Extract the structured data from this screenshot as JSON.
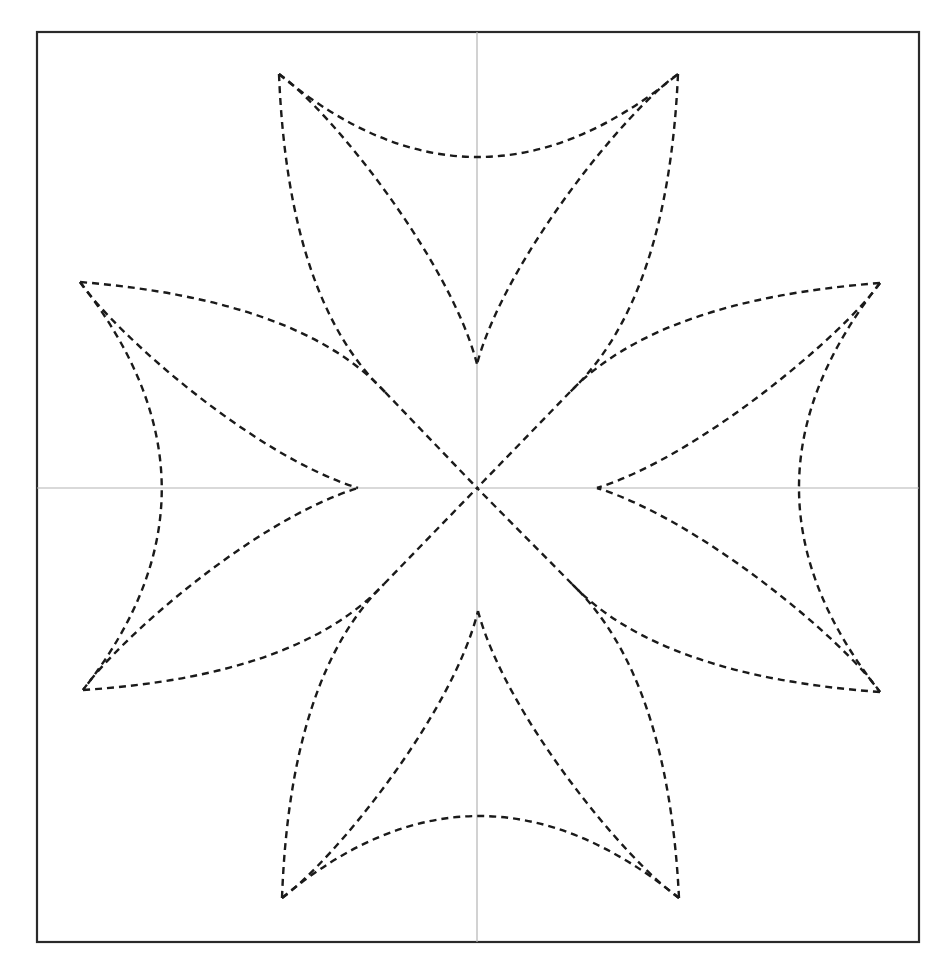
{
  "diagram": {
    "type": "geometric-figure",
    "colors": {
      "background": "#ffffff",
      "frame": "#2a2a2a",
      "axis": "#b4b4b4",
      "curve": "#1a1a1a"
    },
    "frame": {
      "x": 37,
      "y": 32,
      "width": 882,
      "height": 910
    },
    "center": {
      "x": 477,
      "y": 488
    },
    "axes": {
      "vertical": {
        "x": 477,
        "y1": 32,
        "y2": 942
      },
      "horizontal": {
        "y": 488,
        "x1": 37,
        "x2": 919
      }
    },
    "outer_tips": [
      {
        "name": "top-left",
        "x": 279,
        "y": 74
      },
      {
        "name": "top-right",
        "x": 678,
        "y": 74
      },
      {
        "name": "right-top",
        "x": 880,
        "y": 283
      },
      {
        "name": "right-bottom",
        "x": 880,
        "y": 692
      },
      {
        "name": "bottom-right",
        "x": 679,
        "y": 898
      },
      {
        "name": "bottom-left",
        "x": 282,
        "y": 898
      },
      {
        "name": "left-bottom",
        "x": 83,
        "y": 690
      },
      {
        "name": "left-top",
        "x": 80,
        "y": 282
      }
    ],
    "inner_tips": [
      {
        "name": "top",
        "x": 477,
        "y": 364
      },
      {
        "name": "right",
        "x": 597,
        "y": 488
      },
      {
        "name": "bottom",
        "x": 478,
        "y": 611
      },
      {
        "name": "left",
        "x": 358,
        "y": 488
      }
    ],
    "junctions": [
      {
        "name": "upper-left",
        "x": 385,
        "y": 392
      },
      {
        "name": "upper-right",
        "x": 570,
        "y": 392
      },
      {
        "name": "lower-right",
        "x": 572,
        "y": 584
      },
      {
        "name": "lower-left",
        "x": 384,
        "y": 584
      }
    ],
    "paths": [
      {
        "name": "top-arc",
        "d": "M279,74 Q477,240 678,74"
      },
      {
        "name": "bottom-arc",
        "d": "M282,898 Q478,734 679,898"
      },
      {
        "name": "left-arc",
        "d": "M80,282 Q242,488 83,690"
      },
      {
        "name": "right-arc",
        "d": "M880,283 Q718,488 880,692"
      },
      {
        "name": "top-inner-left",
        "d": "M279,74 C330,110 450,260 477,364"
      },
      {
        "name": "top-inner-right",
        "d": "M678,74 C626,110 505,260 477,364"
      },
      {
        "name": "bottom-inner-left",
        "d": "M282,898 C332,862 452,716 478,611"
      },
      {
        "name": "bottom-inner-right",
        "d": "M679,898 C627,862 506,716 478,611"
      },
      {
        "name": "left-inner-top",
        "d": "M80,282 C116,334 254,456 358,488"
      },
      {
        "name": "left-inner-bottom",
        "d": "M83,690 C118,640 254,520 358,488"
      },
      {
        "name": "right-inner-top",
        "d": "M880,283 C844,334 700,456 597,488"
      },
      {
        "name": "right-inner-bottom",
        "d": "M880,692 C844,640 700,520 597,488"
      },
      {
        "name": "top-left-lens-a",
        "d": "M279,74 Q288,300 385,392"
      },
      {
        "name": "top-left-lens-b",
        "d": "M80,282 Q300,300 385,392"
      },
      {
        "name": "top-right-lens-a",
        "d": "M678,74 Q668,300 570,392"
      },
      {
        "name": "top-right-lens-b",
        "d": "M880,283 Q658,300 570,392"
      },
      {
        "name": "bottom-right-lens-a",
        "d": "M679,898 Q668,676 572,584"
      },
      {
        "name": "bottom-right-lens-b",
        "d": "M880,692 Q660,676 572,584"
      },
      {
        "name": "bottom-left-lens-a",
        "d": "M282,898 Q290,676 384,584"
      },
      {
        "name": "bottom-left-lens-b",
        "d": "M83,690 Q298,676 384,584"
      },
      {
        "name": "diag-upper-left",
        "d": "M385,392 L477,488"
      },
      {
        "name": "diag-upper-right",
        "d": "M570,392 L477,488"
      },
      {
        "name": "diag-lower-right",
        "d": "M572,584 L477,488"
      },
      {
        "name": "diag-lower-left",
        "d": "M384,584 L477,488"
      }
    ]
  }
}
